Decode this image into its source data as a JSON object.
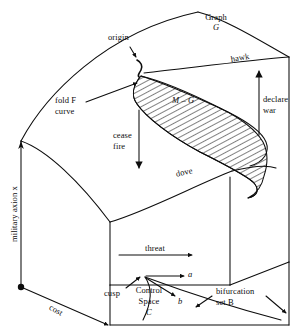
{
  "figure": {
    "type": "cusp-catastrophe-surface-diagram",
    "background": "#ffffff",
    "ink": "#0d0d0d",
    "labels": {
      "graph_name": "Graph",
      "graph_symbol": "G",
      "origin": "origin",
      "fold_line1": "fold F",
      "fold_line2": "curve",
      "region_hatched": "M – G",
      "hawk": "hawk",
      "dove": "dove",
      "declare_line1": "declare",
      "declare_line2": "war",
      "cease_line1": "cease",
      "cease_line2": "fire",
      "axis_vertical": "military axion x",
      "control_line1": "Control",
      "control_line2": "Space",
      "control_symbol": "C",
      "cost": "cost",
      "threat": "threat",
      "cusp": "cusp",
      "control_a": "a",
      "control_b": "b",
      "bifurcation_line1": "bifurcation",
      "bifurcation_line2": "set B"
    }
  }
}
